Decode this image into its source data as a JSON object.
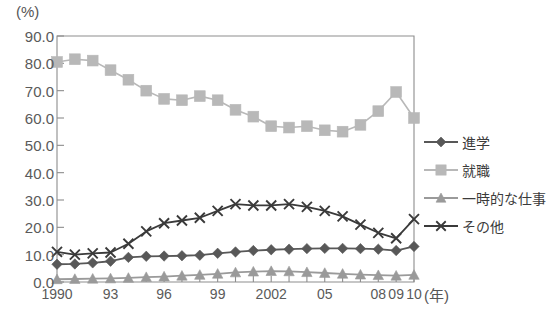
{
  "chart_data": {
    "type": "line",
    "title": "",
    "subtitle": "",
    "xlabel": "(年)",
    "ylabel": "(%)",
    "ylim": [
      0,
      90
    ],
    "ytick_labels": [
      "0.0",
      "10.0",
      "20.0",
      "30.0",
      "40.0",
      "50.0",
      "60.0",
      "70.0",
      "80.0",
      "90.0"
    ],
    "ytick_values": [
      0,
      10,
      20,
      30,
      40,
      50,
      60,
      70,
      80,
      90
    ],
    "grid": false,
    "legend_position": "right",
    "x": [
      1990,
      1991,
      1992,
      1993,
      1994,
      1995,
      1996,
      1997,
      1998,
      1999,
      2000,
      2001,
      2002,
      2003,
      2004,
      2005,
      2006,
      2007,
      2008,
      2009,
      2010
    ],
    "xtick_positions": [
      1990,
      1993,
      1996,
      1999,
      2002,
      2005,
      2008,
      2009,
      2010
    ],
    "xtick_labels": [
      "1990",
      "93",
      "96",
      "99",
      "2002",
      "05",
      "08",
      "09",
      "10"
    ],
    "series": [
      {
        "name": "進学",
        "marker": "diamond",
        "color": "#585858",
        "values": [
          6.5,
          6.6,
          7.0,
          7.6,
          9.0,
          9.4,
          9.5,
          9.6,
          9.8,
          10.5,
          11.0,
          11.5,
          11.8,
          12.0,
          12.2,
          12.3,
          12.3,
          12.2,
          12.0,
          11.5,
          13.0
        ]
      },
      {
        "name": "就職",
        "marker": "square",
        "color": "#b8b8b8",
        "values": [
          80.5,
          81.5,
          81.0,
          77.5,
          74.0,
          70.0,
          67.0,
          66.5,
          68.0,
          66.5,
          63.0,
          60.5,
          57.0,
          56.5,
          57.0,
          55.5,
          55.0,
          57.5,
          62.5,
          69.5,
          60.0
        ]
      },
      {
        "name": "一時的な仕事",
        "marker": "triangle",
        "color": "#9a9a9a",
        "values": [
          1.0,
          1.1,
          1.2,
          1.3,
          1.5,
          1.8,
          2.0,
          2.3,
          2.6,
          3.0,
          3.5,
          3.8,
          4.0,
          3.9,
          3.6,
          3.3,
          3.0,
          2.7,
          2.5,
          2.3,
          2.6
        ]
      },
      {
        "name": "その他",
        "marker": "x",
        "color": "#3a3a3a",
        "values": [
          11.0,
          10.0,
          10.5,
          10.8,
          14.0,
          18.5,
          21.5,
          22.5,
          23.5,
          26.0,
          28.5,
          28.0,
          28.0,
          28.5,
          27.5,
          26.0,
          24.0,
          21.0,
          18.0,
          16.0,
          23.0
        ]
      }
    ]
  },
  "axes": {
    "y_unit": "(%)",
    "x_unit": "(年)"
  },
  "legend": {
    "items": [
      {
        "label": "進学"
      },
      {
        "label": "就職"
      },
      {
        "label": "一時的な仕事"
      },
      {
        "label": "その他"
      }
    ]
  }
}
